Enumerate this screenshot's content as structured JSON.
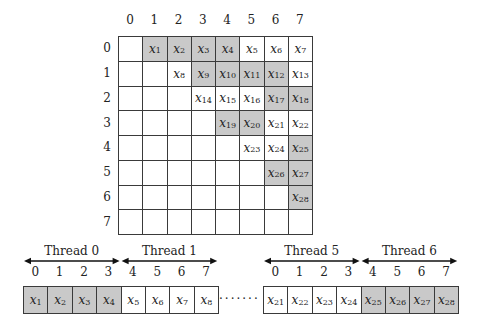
{
  "matrix": {
    "column_labels": [
      "0",
      "1",
      "2",
      "3",
      "4",
      "5",
      "6",
      "7"
    ],
    "row_labels": [
      "0",
      "1",
      "2",
      "3",
      "4",
      "5",
      "6",
      "7"
    ],
    "cells": [
      {
        "row": 0,
        "col": 1,
        "var": "x",
        "sub": "1",
        "highlight": true
      },
      {
        "row": 0,
        "col": 2,
        "var": "x",
        "sub": "2",
        "highlight": true
      },
      {
        "row": 0,
        "col": 3,
        "var": "x",
        "sub": "3",
        "highlight": true
      },
      {
        "row": 0,
        "col": 4,
        "var": "x",
        "sub": "4",
        "highlight": true
      },
      {
        "row": 0,
        "col": 5,
        "var": "x",
        "sub": "5",
        "highlight": false
      },
      {
        "row": 0,
        "col": 6,
        "var": "x",
        "sub": "6",
        "highlight": false
      },
      {
        "row": 0,
        "col": 7,
        "var": "x",
        "sub": "7",
        "highlight": false
      },
      {
        "row": 1,
        "col": 2,
        "var": "x",
        "sub": "8",
        "highlight": false
      },
      {
        "row": 1,
        "col": 3,
        "var": "x",
        "sub": "9",
        "highlight": true
      },
      {
        "row": 1,
        "col": 4,
        "var": "x",
        "sub": "10",
        "highlight": true
      },
      {
        "row": 1,
        "col": 5,
        "var": "x",
        "sub": "11",
        "highlight": true
      },
      {
        "row": 1,
        "col": 6,
        "var": "x",
        "sub": "12",
        "highlight": true
      },
      {
        "row": 1,
        "col": 7,
        "var": "x",
        "sub": "13",
        "highlight": false
      },
      {
        "row": 2,
        "col": 3,
        "var": "x",
        "sub": "14",
        "highlight": false
      },
      {
        "row": 2,
        "col": 4,
        "var": "x",
        "sub": "15",
        "highlight": false
      },
      {
        "row": 2,
        "col": 5,
        "var": "x",
        "sub": "16",
        "highlight": false
      },
      {
        "row": 2,
        "col": 6,
        "var": "x",
        "sub": "17",
        "highlight": true
      },
      {
        "row": 2,
        "col": 7,
        "var": "x",
        "sub": "18",
        "highlight": true
      },
      {
        "row": 3,
        "col": 4,
        "var": "x",
        "sub": "19",
        "highlight": true
      },
      {
        "row": 3,
        "col": 5,
        "var": "x",
        "sub": "20",
        "highlight": true
      },
      {
        "row": 3,
        "col": 6,
        "var": "x",
        "sub": "21",
        "highlight": false
      },
      {
        "row": 3,
        "col": 7,
        "var": "x",
        "sub": "22",
        "highlight": false
      },
      {
        "row": 4,
        "col": 5,
        "var": "x",
        "sub": "23",
        "highlight": false
      },
      {
        "row": 4,
        "col": 6,
        "var": "x",
        "sub": "24",
        "highlight": false
      },
      {
        "row": 4,
        "col": 7,
        "var": "x",
        "sub": "25",
        "highlight": true
      },
      {
        "row": 5,
        "col": 6,
        "var": "x",
        "sub": "26",
        "highlight": true
      },
      {
        "row": 5,
        "col": 7,
        "var": "x",
        "sub": "27",
        "highlight": true
      },
      {
        "row": 6,
        "col": 7,
        "var": "x",
        "sub": "28",
        "highlight": true
      }
    ]
  },
  "threads": {
    "left_segment": {
      "threads": [
        {
          "label": "Thread 0",
          "indices": [
            "0",
            "1",
            "2",
            "3"
          ]
        },
        {
          "label": "Thread 1",
          "indices": [
            "4",
            "5",
            "6",
            "7"
          ]
        }
      ],
      "cells": [
        {
          "var": "x",
          "sub": "1",
          "highlight": true
        },
        {
          "var": "x",
          "sub": "2",
          "highlight": true
        },
        {
          "var": "x",
          "sub": "3",
          "highlight": true
        },
        {
          "var": "x",
          "sub": "4",
          "highlight": true
        },
        {
          "var": "x",
          "sub": "5",
          "highlight": false
        },
        {
          "var": "x",
          "sub": "6",
          "highlight": false
        },
        {
          "var": "x",
          "sub": "7",
          "highlight": false
        },
        {
          "var": "x",
          "sub": "8",
          "highlight": false
        }
      ]
    },
    "ellipsis": "·······",
    "right_segment": {
      "threads": [
        {
          "label": "Thread 5",
          "indices": [
            "0",
            "1",
            "2",
            "3"
          ]
        },
        {
          "label": "Thread 6",
          "indices": [
            "4",
            "5",
            "6",
            "7"
          ]
        }
      ],
      "cells": [
        {
          "var": "x",
          "sub": "21",
          "highlight": false
        },
        {
          "var": "x",
          "sub": "22",
          "highlight": false
        },
        {
          "var": "x",
          "sub": "23",
          "highlight": false
        },
        {
          "var": "x",
          "sub": "24",
          "highlight": false
        },
        {
          "var": "x",
          "sub": "25",
          "highlight": true
        },
        {
          "var": "x",
          "sub": "26",
          "highlight": true
        },
        {
          "var": "x",
          "sub": "27",
          "highlight": true
        },
        {
          "var": "x",
          "sub": "28",
          "highlight": true
        }
      ]
    }
  },
  "colors": {
    "highlight": "#c9c9c9",
    "border": "#3a3a3a",
    "text": "#222222"
  }
}
